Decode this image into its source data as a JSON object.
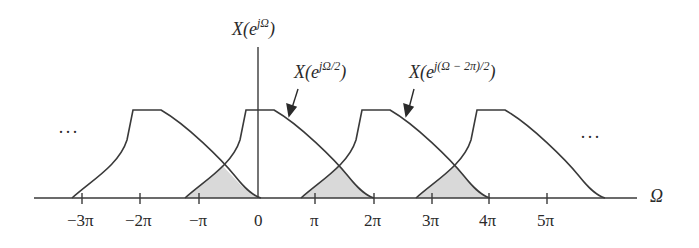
{
  "diagram": {
    "axis": {
      "vertical_label_base": "X(e",
      "vertical_label_exp": "jΩ",
      "vertical_label_close": ")",
      "horizontal_label": "Ω",
      "ticks": [
        "−3π",
        "−2π",
        "−π",
        "0",
        "π",
        "2π",
        "3π",
        "4π",
        "5π"
      ]
    },
    "annotations": [
      {
        "base": "X(e",
        "exp": "jΩ/2",
        "close": ")"
      },
      {
        "base": "X(e",
        "exp": "j(Ω − 2π)/2",
        "close": ")"
      }
    ],
    "ellipsis_left": "···",
    "ellipsis_right": "···",
    "colors": {
      "stroke": "#3a3a3a",
      "alias_fill": "#d9d9d9",
      "background": "#ffffff"
    }
  }
}
